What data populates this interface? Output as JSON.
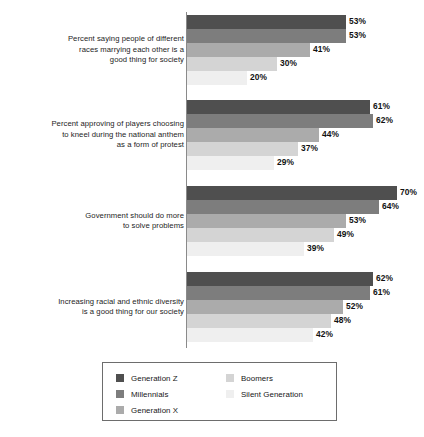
{
  "chart_data": {
    "type": "bar",
    "orientation": "horizontal",
    "title": "",
    "subtitle": "",
    "xlabel": "",
    "ylabel": "",
    "xlim": [
      0,
      79
    ],
    "grid": false,
    "legend_position": "bottom",
    "value_suffix": "%",
    "categories": [
      "Percent saying people of different races marrying each other is a good thing for society",
      "Percent approving of players choosing to kneel during the national anthem as a form of protest",
      "Government should do more to solve problems",
      "Increasing racial and ethnic diversity is a good thing for our society"
    ],
    "series": [
      {
        "name": "Generation Z",
        "color": "#4f4f4f",
        "values": [
          53,
          61,
          70,
          62
        ]
      },
      {
        "name": "Millennials",
        "color": "#7d7d7d",
        "values": [
          53,
          62,
          64,
          61
        ]
      },
      {
        "name": "Generation X",
        "color": "#ababab",
        "values": [
          41,
          44,
          53,
          52
        ]
      },
      {
        "name": "Boomers",
        "color": "#d4d4d4",
        "values": [
          30,
          37,
          49,
          48
        ]
      },
      {
        "name": "Silent Generation",
        "color": "#efefef",
        "values": [
          20,
          29,
          39,
          42
        ]
      }
    ]
  },
  "groups": [
    {
      "label_lines": [
        "Percent saying people of different",
        "races marrying each other is a",
        "good thing for society"
      ],
      "bars": [
        {
          "series": "Generation Z",
          "value": 53,
          "value_label": "53%",
          "color": "#4f4f4f"
        },
        {
          "series": "Millennials",
          "value": 53,
          "value_label": "53%",
          "color": "#7d7d7d"
        },
        {
          "series": "Generation X",
          "value": 41,
          "value_label": "41%",
          "color": "#ababab"
        },
        {
          "series": "Boomers",
          "value": 30,
          "value_label": "30%",
          "color": "#d4d4d4"
        },
        {
          "series": "Silent Generation",
          "value": 20,
          "value_label": "20%",
          "color": "#efefef"
        }
      ]
    },
    {
      "label_lines": [
        "Percent approving of players choosing",
        "to kneel during the national anthem",
        "as a form of protest"
      ],
      "bars": [
        {
          "series": "Generation Z",
          "value": 61,
          "value_label": "61%",
          "color": "#4f4f4f"
        },
        {
          "series": "Millennials",
          "value": 62,
          "value_label": "62%",
          "color": "#7d7d7d"
        },
        {
          "series": "Generation X",
          "value": 44,
          "value_label": "44%",
          "color": "#ababab"
        },
        {
          "series": "Boomers",
          "value": 37,
          "value_label": "37%",
          "color": "#d4d4d4"
        },
        {
          "series": "Silent Generation",
          "value": 29,
          "value_label": "29%",
          "color": "#efefef"
        }
      ]
    },
    {
      "label_lines": [
        "Government should do more",
        "to solve problems"
      ],
      "bars": [
        {
          "series": "Generation Z",
          "value": 70,
          "value_label": "70%",
          "color": "#4f4f4f"
        },
        {
          "series": "Millennials",
          "value": 64,
          "value_label": "64%",
          "color": "#7d7d7d"
        },
        {
          "series": "Generation X",
          "value": 53,
          "value_label": "53%",
          "color": "#ababab"
        },
        {
          "series": "Boomers",
          "value": 49,
          "value_label": "49%",
          "color": "#d4d4d4"
        },
        {
          "series": "Silent Generation",
          "value": 39,
          "value_label": "39%",
          "color": "#efefef"
        }
      ]
    },
    {
      "label_lines": [
        "Increasing racial and ethnic diversity",
        "is a good thing for our society"
      ],
      "bars": [
        {
          "series": "Generation Z",
          "value": 62,
          "value_label": "62%",
          "color": "#4f4f4f"
        },
        {
          "series": "Millennials",
          "value": 61,
          "value_label": "61%",
          "color": "#7d7d7d"
        },
        {
          "series": "Generation X",
          "value": 52,
          "value_label": "52%",
          "color": "#ababab"
        },
        {
          "series": "Boomers",
          "value": 48,
          "value_label": "48%",
          "color": "#d4d4d4"
        },
        {
          "series": "Silent Generation",
          "value": 42,
          "value_label": "42%",
          "color": "#efefef"
        }
      ]
    }
  ],
  "legend": {
    "columns": [
      [
        {
          "label": "Generation Z",
          "color": "#4f4f4f"
        },
        {
          "label": "Millennials",
          "color": "#7d7d7d"
        },
        {
          "label": "Generation X",
          "color": "#ababab"
        }
      ],
      [
        {
          "label": "Boomers",
          "color": "#d4d4d4"
        },
        {
          "label": "Silent Generation",
          "color": "#efefef"
        }
      ]
    ]
  },
  "layout": {
    "axis_origin_x": 187,
    "px_per_percent": 3,
    "bar_height": 14,
    "group_tops": [
      15,
      100,
      186,
      272
    ],
    "axis_color": "#8a8a8a"
  }
}
